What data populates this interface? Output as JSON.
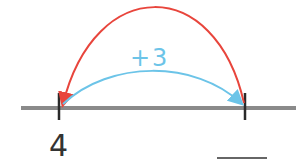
{
  "diagram": {
    "type": "number-line",
    "start_label": "4",
    "jump_label": "+3",
    "answer_blank": "",
    "colors": {
      "line": "#8a8a8a",
      "tick": "#2a2a2a",
      "forward_arrow": "#6cc4e8",
      "back_arrow": "#e8453c",
      "text": "#333333"
    }
  }
}
